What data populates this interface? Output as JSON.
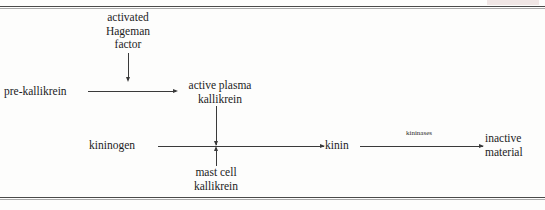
{
  "figure": {
    "ink_color": "#3a3a3a",
    "background_color": "#fdfdfc",
    "nodes": {
      "activated_hageman_factor": "activated\nHageman\nfactor",
      "pre_kallikrein": "pre-kallikrein",
      "active_plasma_kallikrein": "active plasma\nkallikrein",
      "kininogen": "kininogen",
      "mast_cell_kallikrein": "mast cell\nkallikrein",
      "kinin": "kinin",
      "inactive_material": "inactive\nmaterial"
    },
    "edge_labels": {
      "kininases": "kininases"
    }
  }
}
